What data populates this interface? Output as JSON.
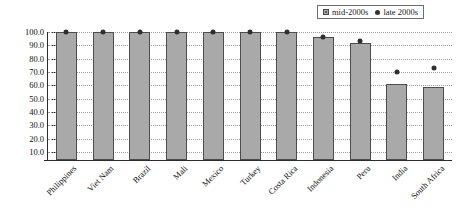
{
  "chart_data": {
    "type": "bar",
    "title": "",
    "xlabel": "",
    "ylabel": "",
    "ylim": [
      0,
      100
    ],
    "grid": true,
    "legend_position": "top-right",
    "categories": [
      "Philippines",
      "Viet Nam",
      "Brazil",
      "Mali",
      "Mexico",
      "Turkey",
      "Costa Rica",
      "Indonesia",
      "Peru",
      "India",
      "South Africa"
    ],
    "yticks": [
      "10.0",
      "20.0",
      "30.0",
      "40.0",
      "50.0",
      "60.0",
      "70.0",
      "80.0",
      "90.0",
      "100.0"
    ],
    "ytick_values": [
      10,
      20,
      30,
      40,
      50,
      60,
      70,
      80,
      90,
      100
    ],
    "series": [
      {
        "name": "mid-2000s",
        "type": "bar",
        "color": "#a9a9a9",
        "values": [
          100.0,
          100.0,
          100.0,
          100.0,
          100.0,
          100.0,
          100.0,
          96.0,
          92.0,
          61.0,
          59.0
        ]
      },
      {
        "name": "late 2000s",
        "type": "scatter",
        "color": "#2e2e2e",
        "values": [
          100.0,
          100.0,
          100.0,
          100.0,
          100.0,
          100.0,
          100.0,
          96.5,
          93.0,
          70.0,
          73.0
        ]
      }
    ]
  },
  "legend": {
    "entries": [
      {
        "label": "mid-2000s",
        "marker": "bar-swatch-icon"
      },
      {
        "label": "late 2000s",
        "marker": "dot-marker-icon"
      }
    ]
  }
}
